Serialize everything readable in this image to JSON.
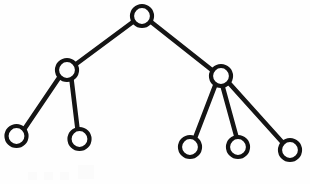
{
  "figure": {
    "kind": "node-link-tree-diagram",
    "title": "",
    "caption": "",
    "width": 310,
    "height": 184,
    "background_color": "#fefefe",
    "stroke_color": "#151515",
    "node_fill_color": "#ffffff",
    "node_stroke_width": 4.2,
    "edge_stroke_width": 4.6,
    "node_radius": 10
  },
  "graph": {
    "node_count": 8,
    "edge_count": 7,
    "depth": 3,
    "nodes": [
      {
        "id": "root",
        "role": "root",
        "label": "",
        "cx": 142.0,
        "cy": 16.0,
        "r": 10.0,
        "depth": 0
      },
      {
        "id": "n-l",
        "role": "internal",
        "label": "",
        "cx": 67.0,
        "cy": 70.0,
        "r": 10.0,
        "depth": 1
      },
      {
        "id": "n-r",
        "role": "internal",
        "label": "",
        "cx": 221.0,
        "cy": 76.0,
        "r": 10.0,
        "depth": 1
      },
      {
        "id": "leaf-1",
        "role": "leaf",
        "label": "",
        "cx": 16.5,
        "cy": 136.0,
        "r": 10.0,
        "depth": 2
      },
      {
        "id": "leaf-2",
        "role": "leaf",
        "label": "",
        "cx": 79.5,
        "cy": 139.0,
        "r": 10.0,
        "depth": 2
      },
      {
        "id": "leaf-3",
        "role": "leaf",
        "label": "",
        "cx": 190.0,
        "cy": 147.0,
        "r": 10.0,
        "depth": 2
      },
      {
        "id": "leaf-4",
        "role": "leaf",
        "label": "",
        "cx": 238.0,
        "cy": 147.0,
        "r": 10.0,
        "depth": 2
      },
      {
        "id": "leaf-5",
        "role": "leaf",
        "label": "",
        "cx": 290.0,
        "cy": 150.0,
        "r": 10.0,
        "depth": 2
      }
    ],
    "edges": [
      {
        "id": "e-root-l",
        "from": "root",
        "to": "n-l",
        "x1": 133.5,
        "y1": 21.5,
        "x2": 75.5,
        "y2": 64.5
      },
      {
        "id": "e-root-r",
        "from": "root",
        "to": "n-r",
        "x1": 150.5,
        "y1": 21.5,
        "x2": 212.5,
        "y2": 70.5
      },
      {
        "id": "e-l-leaf1",
        "from": "n-l",
        "to": "leaf-1",
        "x1": 59.5,
        "y1": 77.0,
        "x2": 24.0,
        "y2": 129.5
      },
      {
        "id": "e-l-leaf2",
        "from": "n-l",
        "to": "leaf-2",
        "x1": 71.5,
        "y1": 79.5,
        "x2": 77.5,
        "y2": 129.0
      },
      {
        "id": "e-r-leaf3",
        "from": "n-r",
        "to": "leaf-3",
        "x1": 215.5,
        "y1": 84.5,
        "x2": 195.0,
        "y2": 138.0
      },
      {
        "id": "e-r-leaf4",
        "from": "n-r",
        "to": "leaf-4",
        "x1": 222.5,
        "y1": 86.0,
        "x2": 236.5,
        "y2": 137.0
      },
      {
        "id": "e-r-leaf5",
        "from": "n-r",
        "to": "leaf-5",
        "x1": 229.0,
        "y1": 83.0,
        "x2": 283.0,
        "y2": 143.0
      }
    ]
  },
  "artifacts": {
    "description": "faint scan smudges along bottom edge",
    "marks": [
      {
        "x": 28,
        "y": 172,
        "w": 9,
        "h": 8
      },
      {
        "x": 44,
        "y": 172,
        "w": 9,
        "h": 8
      },
      {
        "x": 60,
        "y": 172,
        "w": 9,
        "h": 8
      },
      {
        "x": 78,
        "y": 165,
        "w": 16,
        "h": 14
      }
    ]
  }
}
